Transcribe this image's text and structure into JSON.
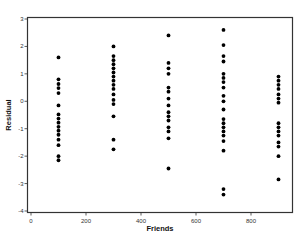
{
  "chart_data": {
    "type": "scatter",
    "title": "",
    "xlabel": "Friends",
    "ylabel": "Residual",
    "xlim": [
      -15,
      945
    ],
    "ylim": [
      -4,
      3
    ],
    "xticks": [
      0,
      200,
      400,
      600,
      800
    ],
    "yticks": [
      -4,
      -3,
      -2,
      -1,
      0,
      1,
      2,
      3
    ],
    "xtick_labels": [
      "0",
      "200",
      "400",
      "600",
      "800"
    ],
    "ytick_labels": [
      "-4",
      "-3",
      "-2",
      "-1",
      "0",
      "1",
      "2",
      "3"
    ],
    "grid": false,
    "legend": null,
    "marker_color": "#000000",
    "series": [
      {
        "name": "Residuals",
        "points": [
          {
            "x": 100,
            "y": 1.6
          },
          {
            "x": 100,
            "y": 0.8
          },
          {
            "x": 100,
            "y": 0.63
          },
          {
            "x": 100,
            "y": 0.48
          },
          {
            "x": 100,
            "y": 0.3
          },
          {
            "x": 100,
            "y": -0.15
          },
          {
            "x": 100,
            "y": -0.48
          },
          {
            "x": 100,
            "y": -0.63
          },
          {
            "x": 100,
            "y": -0.78
          },
          {
            "x": 100,
            "y": -0.93
          },
          {
            "x": 100,
            "y": -1.07
          },
          {
            "x": 100,
            "y": -1.22
          },
          {
            "x": 100,
            "y": -1.4
          },
          {
            "x": 100,
            "y": -1.6
          },
          {
            "x": 100,
            "y": -2.0
          },
          {
            "x": 100,
            "y": -2.15
          },
          {
            "x": 300,
            "y": 2.0
          },
          {
            "x": 300,
            "y": 1.65
          },
          {
            "x": 300,
            "y": 1.5
          },
          {
            "x": 300,
            "y": 1.35
          },
          {
            "x": 300,
            "y": 1.2
          },
          {
            "x": 300,
            "y": 1.05
          },
          {
            "x": 300,
            "y": 0.9
          },
          {
            "x": 300,
            "y": 0.75
          },
          {
            "x": 300,
            "y": 0.6
          },
          {
            "x": 300,
            "y": 0.45
          },
          {
            "x": 300,
            "y": 0.25
          },
          {
            "x": 300,
            "y": 0.05
          },
          {
            "x": 300,
            "y": -0.1
          },
          {
            "x": 300,
            "y": -0.55
          },
          {
            "x": 300,
            "y": -1.4
          },
          {
            "x": 300,
            "y": -1.75
          },
          {
            "x": 500,
            "y": 2.4
          },
          {
            "x": 500,
            "y": 1.4
          },
          {
            "x": 500,
            "y": 1.2
          },
          {
            "x": 500,
            "y": 1.0
          },
          {
            "x": 500,
            "y": 0.5
          },
          {
            "x": 500,
            "y": 0.35
          },
          {
            "x": 500,
            "y": 0.1
          },
          {
            "x": 500,
            "y": -0.15
          },
          {
            "x": 500,
            "y": -0.4
          },
          {
            "x": 500,
            "y": -0.55
          },
          {
            "x": 500,
            "y": -0.7
          },
          {
            "x": 500,
            "y": -0.95
          },
          {
            "x": 500,
            "y": -1.1
          },
          {
            "x": 500,
            "y": -1.35
          },
          {
            "x": 500,
            "y": -2.45
          },
          {
            "x": 700,
            "y": 2.6
          },
          {
            "x": 700,
            "y": 2.05
          },
          {
            "x": 700,
            "y": 1.65
          },
          {
            "x": 700,
            "y": 1.45
          },
          {
            "x": 700,
            "y": 1.0
          },
          {
            "x": 700,
            "y": 0.85
          },
          {
            "x": 700,
            "y": 0.7
          },
          {
            "x": 700,
            "y": 0.5
          },
          {
            "x": 700,
            "y": 0.2
          },
          {
            "x": 700,
            "y": 0.0
          },
          {
            "x": 700,
            "y": -0.3
          },
          {
            "x": 700,
            "y": -0.65
          },
          {
            "x": 700,
            "y": -0.8
          },
          {
            "x": 700,
            "y": -0.95
          },
          {
            "x": 700,
            "y": -1.1
          },
          {
            "x": 700,
            "y": -1.25
          },
          {
            "x": 700,
            "y": -1.45
          },
          {
            "x": 700,
            "y": -1.8
          },
          {
            "x": 700,
            "y": -3.2
          },
          {
            "x": 700,
            "y": -3.4
          },
          {
            "x": 900,
            "y": 0.9
          },
          {
            "x": 900,
            "y": 0.75
          },
          {
            "x": 900,
            "y": 0.6
          },
          {
            "x": 900,
            "y": 0.45
          },
          {
            "x": 900,
            "y": 0.25
          },
          {
            "x": 900,
            "y": 0.1
          },
          {
            "x": 900,
            "y": -0.05
          },
          {
            "x": 900,
            "y": -0.8
          },
          {
            "x": 900,
            "y": -0.95
          },
          {
            "x": 900,
            "y": -1.1
          },
          {
            "x": 900,
            "y": -1.25
          },
          {
            "x": 900,
            "y": -1.5
          },
          {
            "x": 900,
            "y": -1.65
          },
          {
            "x": 900,
            "y": -2.0
          },
          {
            "x": 900,
            "y": -2.85
          }
        ]
      }
    ]
  }
}
